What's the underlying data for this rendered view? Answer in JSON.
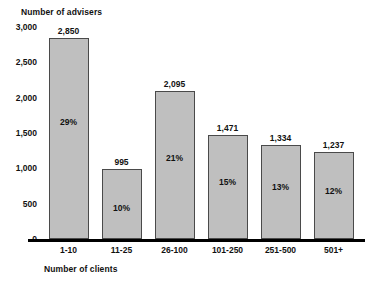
{
  "chart_data": {
    "type": "bar",
    "title": "",
    "xlabel": "Number of clients",
    "ylabel": "Number of advisers",
    "categories": [
      "1-10",
      "11-25",
      "26-100",
      "101-250",
      "251-500",
      "501+"
    ],
    "values": [
      2850,
      995,
      2095,
      1471,
      1334,
      1237
    ],
    "value_labels": [
      "2,850",
      "995",
      "2,095",
      "1,471",
      "1,334",
      "1,237"
    ],
    "percent_labels": [
      "29%",
      "10%",
      "21%",
      "15%",
      "13%",
      "12%"
    ],
    "percent_values": [
      29,
      10,
      21,
      15,
      13,
      12
    ],
    "ylim": [
      0,
      3000
    ],
    "ytick_values": [
      0,
      500,
      1000,
      1500,
      2000,
      2500,
      3000
    ],
    "ytick_labels": [
      "0",
      "500",
      "1,000",
      "1,500",
      "2,000",
      "2,500",
      "3,000"
    ],
    "grid": false,
    "legend": "none",
    "series": [
      {
        "name": "Number of advisers",
        "values": [
          2850,
          995,
          2095,
          1471,
          1334,
          1237
        ]
      }
    ],
    "colors": {
      "bar_fill": "#bfbfbf",
      "bar_border": "#4a4a4a",
      "axis": "#000000",
      "text": "#111111",
      "background": "#ffffff"
    }
  }
}
